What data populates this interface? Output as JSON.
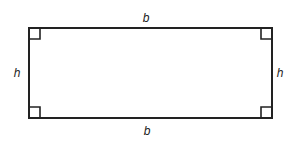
{
  "figure": {
    "shape": "rectangle",
    "stroke_color": "#222222",
    "rect": {
      "x1": 29,
      "y1": 28,
      "x2": 272,
      "y2": 118
    },
    "right_angle_marker_size": 11,
    "labels": {
      "top": "b",
      "bottom": "b",
      "left": "h",
      "right": "h"
    }
  }
}
